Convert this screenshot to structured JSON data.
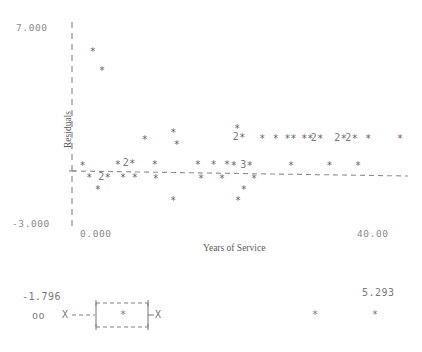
{
  "chart_data": {
    "type": "scatter",
    "title": "",
    "xlabel": "Years of Service",
    "ylabel": "Residuals",
    "xlim": [
      0.0,
      40.0
    ],
    "ylim": [
      -3.0,
      7.0
    ],
    "grid": false,
    "legend": "none",
    "axis_labels": {
      "y_top": "7.000",
      "y_bottom": "-3.000",
      "x_left": "0.000",
      "x_right": "40.00"
    },
    "reference_line": {
      "style": "dashed",
      "label": "zero-residual-line",
      "y_at_xmin": 0.18,
      "y_at_xmax": -0.05
    },
    "point_marker": "*",
    "overlap_digit_meaning": "digit shows number of coincident points",
    "points": [
      {
        "x": 2.4,
        "y": 5.55,
        "n": 1
      },
      {
        "x": 3.5,
        "y": 4.6,
        "n": 1
      },
      {
        "x": 8.6,
        "y": 1.25,
        "n": 1
      },
      {
        "x": 12.0,
        "y": 1.6,
        "n": 1
      },
      {
        "x": 12.4,
        "y": 1.05,
        "n": 1
      },
      {
        "x": 19.6,
        "y": 1.8,
        "n": 1
      },
      {
        "x": 20.2,
        "y": 1.35,
        "n": 2
      },
      {
        "x": 22.6,
        "y": 1.3,
        "n": 1
      },
      {
        "x": 24.2,
        "y": 1.3,
        "n": 1
      },
      {
        "x": 25.6,
        "y": 1.3,
        "n": 1
      },
      {
        "x": 26.3,
        "y": 1.3,
        "n": 1
      },
      {
        "x": 27.6,
        "y": 1.3,
        "n": 1
      },
      {
        "x": 28.3,
        "y": 1.3,
        "n": 1
      },
      {
        "x": 29.5,
        "y": 1.3,
        "n": 2
      },
      {
        "x": 32.3,
        "y": 1.3,
        "n": 2
      },
      {
        "x": 33.6,
        "y": 1.3,
        "n": 2
      },
      {
        "x": 35.2,
        "y": 1.3,
        "n": 1
      },
      {
        "x": 39.0,
        "y": 1.3,
        "n": 1
      },
      {
        "x": 1.2,
        "y": 0.0,
        "n": 1
      },
      {
        "x": 5.4,
        "y": 0.05,
        "n": 1
      },
      {
        "x": 7.1,
        "y": 0.1,
        "n": 2
      },
      {
        "x": 9.8,
        "y": 0.05,
        "n": 1
      },
      {
        "x": 14.9,
        "y": 0.05,
        "n": 1
      },
      {
        "x": 16.8,
        "y": 0.05,
        "n": 1
      },
      {
        "x": 18.4,
        "y": 0.05,
        "n": 1
      },
      {
        "x": 19.2,
        "y": 0.02,
        "n": 1
      },
      {
        "x": 21.1,
        "y": 0.02,
        "n": 3
      },
      {
        "x": 26.0,
        "y": 0.0,
        "n": 1
      },
      {
        "x": 30.6,
        "y": 0.0,
        "n": 1
      },
      {
        "x": 34.0,
        "y": 0.0,
        "n": 1
      },
      {
        "x": 2.0,
        "y": -0.55,
        "n": 1
      },
      {
        "x": 4.2,
        "y": -0.55,
        "n": 2
      },
      {
        "x": 6.0,
        "y": -0.55,
        "n": 1
      },
      {
        "x": 7.4,
        "y": -0.55,
        "n": 1
      },
      {
        "x": 9.9,
        "y": -0.6,
        "n": 1
      },
      {
        "x": 15.3,
        "y": -0.6,
        "n": 1
      },
      {
        "x": 17.8,
        "y": -0.6,
        "n": 1
      },
      {
        "x": 21.6,
        "y": -0.6,
        "n": 1
      },
      {
        "x": 3.0,
        "y": -1.15,
        "n": 1
      },
      {
        "x": 20.4,
        "y": -1.15,
        "n": 1
      },
      {
        "x": 12.0,
        "y": -1.7,
        "n": 1
      },
      {
        "x": 19.7,
        "y": -1.7,
        "n": 1
      }
    ]
  },
  "boxplot": {
    "name": "residuals-boxplot",
    "min_label": "-1.796",
    "max_label": "5.293",
    "low_outliers_glyph": "oo",
    "whisker_low_cap": "X",
    "whisker_high_cap": "X",
    "median_glyph": "*",
    "high_outliers_glyph": "*",
    "high_outlier_count": 2
  }
}
